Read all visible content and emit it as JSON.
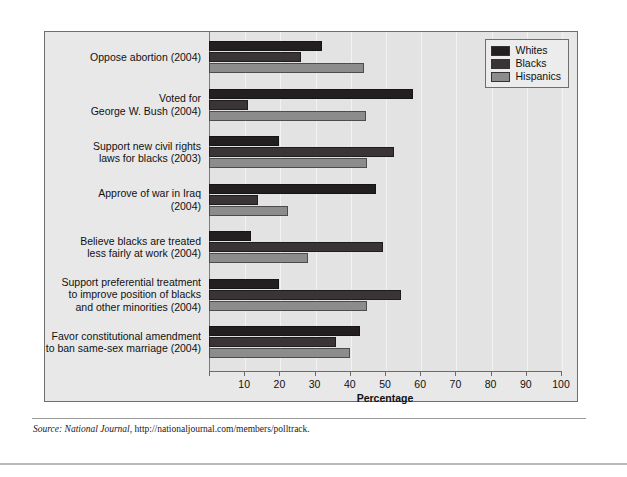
{
  "chart_data": {
    "type": "bar",
    "orientation": "horizontal",
    "title": "",
    "xlabel": "Percentage",
    "ylabel": "",
    "xlim": [
      0,
      100
    ],
    "xticks": [
      0,
      10,
      20,
      30,
      40,
      50,
      60,
      70,
      80,
      90,
      100
    ],
    "xtick_labels": [
      "",
      "10",
      "20",
      "30",
      "40",
      "50",
      "60",
      "70",
      "80",
      "90",
      "100"
    ],
    "grid": true,
    "legend_position": "top-right",
    "categories": [
      "Oppose abortion (2004)",
      "Voted for\nGeorge W. Bush (2004)",
      "Support new civil rights\nlaws for blacks (2003)",
      "Approve of war in Iraq\n(2004)",
      "Believe blacks are treated\nless fairly at work (2004)",
      "Support preferential treatment\nto improve position of blacks\nand other minorities (2004)",
      "Favor constitutional amendment\nto ban same-sex marriage (2004)"
    ],
    "series": [
      {
        "name": "Whites",
        "color": "#231f20",
        "values": [
          32,
          58,
          20,
          47.5,
          12,
          20,
          43
        ]
      },
      {
        "name": "Blacks",
        "color": "#3a3436",
        "values": [
          26,
          11,
          52.5,
          14,
          49.5,
          54.5,
          36
        ]
      },
      {
        "name": "Hispanics",
        "color": "#8c8c8c",
        "values": [
          44,
          44.5,
          45,
          22.5,
          28,
          45,
          40
        ]
      }
    ]
  },
  "legend": {
    "items": [
      {
        "label": "Whites"
      },
      {
        "label": "Blacks"
      },
      {
        "label": "Hispanics"
      }
    ]
  },
  "source": {
    "prefix": "Source:",
    "publication": "National Journal",
    "url": ", http://nationaljournal.com/members/polltrack."
  }
}
